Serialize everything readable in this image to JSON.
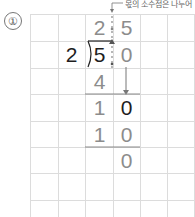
{
  "problem": {
    "number_label": "①",
    "annotation": "몫의 소수점은 나누어",
    "divisor": "2",
    "dividend": [
      "5",
      "0"
    ],
    "quotient": [
      "2",
      "5"
    ],
    "work_rows": [
      [
        "4",
        ""
      ],
      [
        "1",
        "0"
      ],
      [
        "1",
        "0"
      ],
      [
        "",
        "0"
      ]
    ]
  },
  "colors": {
    "grid": "#dcdcdc",
    "problem_digits": "#1e1e1e",
    "work_digits": "#8c8c8c"
  }
}
